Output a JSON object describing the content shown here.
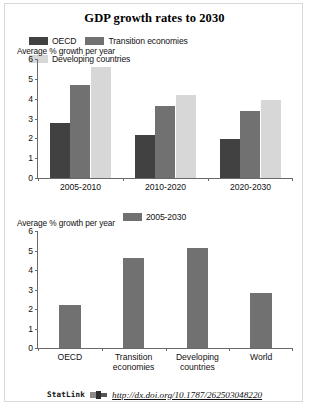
{
  "figure": {
    "title": "GDP growth rates to 2030"
  },
  "statlink": {
    "word": "StatLink",
    "icon": "statlink-icon",
    "url": "http://dx.doi.org/10.1787/262503048220"
  },
  "colors": {
    "oecd": "#414141",
    "transition": "#717171",
    "developing": "#d7d7d7",
    "single_series": "#717171",
    "axis": "#6a6a6a",
    "frame": "#d9d9d9"
  },
  "chart_data": [
    {
      "type": "bar",
      "id": "chart-top",
      "title": "GDP growth rates to 2030",
      "ylabel": "Average % growth per year",
      "xlabel": "",
      "categories": [
        "2005-2010",
        "2010-2020",
        "2020-2030"
      ],
      "series": [
        {
          "name": "OECD",
          "color": "#414141",
          "values": [
            2.75,
            2.15,
            1.95
          ]
        },
        {
          "name": "Transition economies",
          "color": "#717171",
          "values": [
            4.7,
            3.65,
            3.4
          ]
        },
        {
          "name": "Developing countries",
          "color": "#d7d7d7",
          "values": [
            5.6,
            4.2,
            3.95
          ]
        }
      ],
      "yticks": [
        0,
        1,
        2,
        3,
        4,
        5,
        6
      ],
      "ylim": [
        0,
        6
      ],
      "grid": false,
      "legend_position": "top"
    },
    {
      "type": "bar",
      "id": "chart-bottom",
      "title": "",
      "ylabel": "Average % growth per year",
      "xlabel": "",
      "categories": [
        "OECD",
        "Transition economies",
        "Developing countries",
        "World"
      ],
      "category_lines": [
        [
          "OECD"
        ],
        [
          "Transition",
          "economies"
        ],
        [
          "Developing",
          "countries"
        ],
        [
          "World"
        ]
      ],
      "series": [
        {
          "name": "2005-2030",
          "color": "#717171",
          "values": [
            2.2,
            4.6,
            5.15,
            2.8
          ]
        }
      ],
      "yticks": [
        0,
        1,
        2,
        3,
        4,
        5,
        6
      ],
      "ylim": [
        0,
        6
      ],
      "grid": false,
      "legend_position": "top"
    }
  ]
}
